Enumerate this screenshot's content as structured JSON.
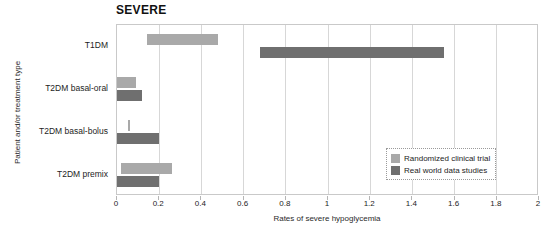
{
  "chart_data": {
    "type": "bar",
    "bar_style": "horizontal-range",
    "title": "SEVERE",
    "xlabel": "Rates of severe hypoglycemia",
    "ylabel": "Patient and/or treatment type",
    "xlim": [
      0,
      2
    ],
    "xticks": [
      0,
      0.2,
      0.4,
      0.6,
      0.8,
      1,
      1.2,
      1.4,
      1.6,
      1.8,
      2
    ],
    "xtick_labels": [
      "0",
      "0.2",
      "0.4",
      "0.6",
      "0.8",
      "1",
      "1.2",
      "1.4",
      "1.6",
      "1.8",
      "2"
    ],
    "grid": true,
    "grid_axis": "x",
    "legend_position": "lower right",
    "categories": [
      "T1DM",
      "T2DM basal-oral",
      "T2DM basal-bolus",
      "T2DM premix"
    ],
    "series": [
      {
        "name": "Randomized clinical trial",
        "color": "#a9a9a9",
        "ranges": [
          {
            "category": "T1DM",
            "start": 0.14,
            "end": 0.48
          },
          {
            "category": "T2DM basal-oral",
            "start": 0.0,
            "end": 0.09
          },
          {
            "category": "T2DM basal-bolus",
            "start": 0.05,
            "end": 0.06
          },
          {
            "category": "T2DM premix",
            "start": 0.02,
            "end": 0.26
          }
        ]
      },
      {
        "name": "Real world data studies",
        "color": "#6f6f6f",
        "ranges": [
          {
            "category": "T1DM",
            "start": 0.68,
            "end": 1.55
          },
          {
            "category": "T2DM basal-oral",
            "start": 0.0,
            "end": 0.12
          },
          {
            "category": "T2DM basal-bolus",
            "start": 0.0,
            "end": 0.2
          },
          {
            "category": "T2DM premix",
            "start": 0.0,
            "end": 0.2
          }
        ]
      }
    ]
  },
  "legend": {
    "items": [
      {
        "label": "Randomized clinical trial",
        "color": "#a9a9a9",
        "key": "rct"
      },
      {
        "label": "Real world data studies",
        "color": "#6f6f6f",
        "key": "rwd"
      }
    ]
  }
}
